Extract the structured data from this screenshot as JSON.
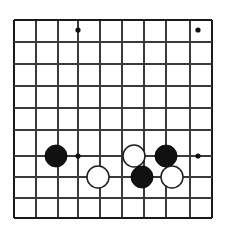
{
  "figure": {
    "kind": "go-board-diagram",
    "background_color": "#ffffff"
  },
  "board": {
    "label": "Go board grid",
    "visible_columns": 10,
    "visible_rows": 10,
    "cell_size_px": 22,
    "origin_x_px": 14,
    "origin_y_px": 20,
    "line_color": "#3a3a3a",
    "edge_line_color": "#1a1a1a",
    "line_width_px": 1.15,
    "edge_line_width_px": 2.3,
    "vertical_lines_x": [
      14,
      36,
      58,
      78,
      100,
      122,
      144,
      166,
      190,
      212
    ],
    "horizontal_lines_y": [
      20,
      42,
      64,
      86,
      108,
      130,
      156,
      177,
      198,
      218
    ],
    "edge_lines": {
      "left_x": 14,
      "right_x": 212,
      "top_y": 20,
      "bottom_y": 218
    }
  },
  "star_points": {
    "label": "Star points (hoshi)",
    "radius_px": 2.6,
    "color": "#111111",
    "points": [
      {
        "name": "hoshi-top-left",
        "x": 78,
        "y": 30
      },
      {
        "name": "hoshi-top-right",
        "x": 198,
        "y": 30
      },
      {
        "name": "hoshi-bottom-left",
        "x": 78,
        "y": 156
      },
      {
        "name": "hoshi-bottom-right",
        "x": 198,
        "y": 156
      }
    ]
  },
  "stones": {
    "label": "Stones on board",
    "radius_px": 11,
    "black_color": "#111111",
    "white_color": "#ffffff",
    "white_outline_color": "#1d1d1d",
    "items": [
      {
        "name": "stone-black-left",
        "color": "black",
        "x": 56,
        "y": 156
      },
      {
        "name": "stone-white-lower-left",
        "color": "white",
        "x": 98,
        "y": 177
      },
      {
        "name": "stone-white-upper",
        "color": "white",
        "x": 134,
        "y": 156
      },
      {
        "name": "stone-black-upper-right",
        "color": "black",
        "x": 166,
        "y": 156
      },
      {
        "name": "stone-black-lower",
        "color": "black",
        "x": 142,
        "y": 177
      },
      {
        "name": "stone-white-lower-right",
        "color": "white",
        "x": 172,
        "y": 177
      }
    ],
    "counts": {
      "black": 3,
      "white": 3,
      "total": 6
    }
  }
}
